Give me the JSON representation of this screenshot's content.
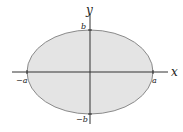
{
  "diagram": {
    "type": "ellipse",
    "colors": {
      "fill": "#e4e4e4",
      "stroke": "#8a8a8a",
      "axis": "#333333"
    },
    "axes": {
      "x_label": "x",
      "y_label": "y"
    },
    "ticks": {
      "pos_a": "a",
      "neg_a": "−a",
      "pos_b": "b",
      "neg_b": "−b"
    }
  }
}
